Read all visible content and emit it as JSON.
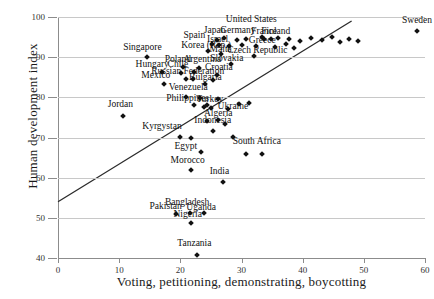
{
  "chart_data": {
    "type": "scatter",
    "title": "",
    "xlabel": "Voting, petitioning, demonstrating, boycotting",
    "ylabel": "Human development index",
    "xlim": [
      0,
      60
    ],
    "ylim": [
      40,
      100
    ],
    "xticks": [
      0,
      10,
      20,
      30,
      40,
      50,
      60
    ],
    "yticks": [
      40,
      50,
      60,
      70,
      80,
      90,
      100
    ],
    "grid": "horizontal",
    "legend": "none",
    "trendline": {
      "x0": 0,
      "y0": 54,
      "x1": 48,
      "y1": 99
    },
    "points": [
      {
        "label": "Sweden",
        "x": 58.7,
        "y": 96.5,
        "lx": 58.7,
        "ly": 99.0
      },
      {
        "label": "United States",
        "x": 33.4,
        "y": 95.0,
        "lx": 31.6,
        "ly": 99.2
      },
      {
        "label": "Japan",
        "x": 26.0,
        "y": 94.3,
        "lx": 25.6,
        "ly": 96.4
      },
      {
        "label": "Germany",
        "x": 29.3,
        "y": 94.2,
        "lx": 29.4,
        "ly": 96.4
      },
      {
        "label": "France",
        "x": 33.6,
        "y": 94.6,
        "lx": 33.7,
        "ly": 96.3
      },
      {
        "label": "Finland",
        "x": 36.0,
        "y": 94.7,
        "lx": 35.6,
        "ly": 96.3
      },
      {
        "label": "Spain",
        "x": 25.2,
        "y": 93.2,
        "lx": 22.3,
        "ly": 95.2
      },
      {
        "label": "Israel",
        "x": 26.4,
        "y": 93.0,
        "lx": 26.1,
        "ly": 94.2
      },
      {
        "label": "Greece",
        "x": 32.3,
        "y": 92.8,
        "lx": 33.4,
        "ly": 94.0
      },
      {
        "label": "Korea (Rep.)",
        "x": 24.6,
        "y": 91.6,
        "lx": 24.2,
        "ly": 92.9
      },
      {
        "label": "Malta",
        "x": 26.7,
        "y": 90.9,
        "lx": 26.6,
        "ly": 91.7
      },
      {
        "label": "Czech Republic",
        "x": 32.0,
        "y": 90.4,
        "lx": 32.6,
        "ly": 91.6
      },
      {
        "label": "Slovakia",
        "x": 28.3,
        "y": 88.2,
        "lx": 27.6,
        "ly": 89.6
      },
      {
        "label": "Singapore",
        "x": 14.5,
        "y": 90.0,
        "lx": 13.8,
        "ly": 92.2
      },
      {
        "label": "Poland",
        "x": 20.4,
        "y": 87.5,
        "lx": 19.6,
        "ly": 89.3
      },
      {
        "label": "Argentina",
        "x": 23.0,
        "y": 87.4,
        "lx": 23.6,
        "ly": 89.2
      },
      {
        "label": "Hungary",
        "x": 17.0,
        "y": 86.3,
        "lx": 15.4,
        "ly": 88.0
      },
      {
        "label": "Chile",
        "x": 20.1,
        "y": 86.0,
        "lx": 19.6,
        "ly": 88.0
      },
      {
        "label": "Croatia",
        "x": 26.0,
        "y": 85.6,
        "lx": 26.3,
        "ly": 87.2
      },
      {
        "label": "Russian Federation",
        "x": 21.0,
        "y": 84.5,
        "lx": 21.2,
        "ly": 86.2
      },
      {
        "label": "Mexico",
        "x": 17.3,
        "y": 83.3,
        "lx": 16.0,
        "ly": 85.3
      },
      {
        "label": "Bulgaria",
        "x": 24.0,
        "y": 83.3,
        "lx": 24.1,
        "ly": 84.9
      },
      {
        "label": "Venezuela",
        "x": 20.9,
        "y": 80.2,
        "lx": 21.3,
        "ly": 82.2
      },
      {
        "label": "Philippines",
        "x": 22.3,
        "y": 78.0,
        "lx": 21.2,
        "ly": 79.5
      },
      {
        "label": "Turkey",
        "x": 24.4,
        "y": 78.2,
        "lx": 24.8,
        "ly": 79.4
      },
      {
        "label": "Ukraine",
        "x": 27.8,
        "y": 77.0,
        "lx": 28.6,
        "ly": 77.7
      },
      {
        "label": "Jordan",
        "x": 10.6,
        "y": 75.4,
        "lx": 10.2,
        "ly": 78.0
      },
      {
        "label": "Algeria",
        "x": 26.2,
        "y": 74.3,
        "lx": 26.2,
        "ly": 75.8
      },
      {
        "label": "Indonesia",
        "x": 25.4,
        "y": 71.5,
        "lx": 25.3,
        "ly": 74.0
      },
      {
        "label": "Kyrgystan",
        "x": 20.0,
        "y": 70.2,
        "lx": 17.0,
        "ly": 72.6
      },
      {
        "label": "Egypt",
        "x": 23.3,
        "y": 66.5,
        "lx": 20.9,
        "ly": 67.6
      },
      {
        "label": "South Africa",
        "x": 33.4,
        "y": 66.0,
        "lx": 32.5,
        "ly": 68.8
      },
      {
        "label": "Morocco",
        "x": 21.7,
        "y": 61.8,
        "lx": 21.2,
        "ly": 64.2
      },
      {
        "label": "India",
        "x": 27.0,
        "y": 59.0,
        "lx": 26.4,
        "ly": 61.4
      },
      {
        "label": "Bangladesh",
        "x": 21.6,
        "y": 51.2,
        "lx": 21.1,
        "ly": 53.8
      },
      {
        "label": "Uganda",
        "x": 23.8,
        "y": 51.2,
        "lx": 23.4,
        "ly": 52.5
      },
      {
        "label": "Pakistan",
        "x": 19.3,
        "y": 51.0,
        "lx": 17.6,
        "ly": 52.6
      },
      {
        "label": "Nigeria",
        "x": 21.7,
        "y": 48.8,
        "lx": 21.2,
        "ly": 50.6
      },
      {
        "label": "Tanzania",
        "x": 22.7,
        "y": 40.7,
        "lx": 22.3,
        "ly": 43.4
      }
    ],
    "extra_points": [
      {
        "x": 27.2,
        "y": 94.8
      },
      {
        "x": 30.8,
        "y": 94.4
      },
      {
        "x": 34.9,
        "y": 94.4
      },
      {
        "x": 37.8,
        "y": 94.6
      },
      {
        "x": 39.6,
        "y": 94.1
      },
      {
        "x": 41.4,
        "y": 94.8
      },
      {
        "x": 43.2,
        "y": 94.2
      },
      {
        "x": 44.8,
        "y": 94.9
      },
      {
        "x": 46.1,
        "y": 93.8
      },
      {
        "x": 47.6,
        "y": 94.6
      },
      {
        "x": 49.1,
        "y": 94.0
      },
      {
        "x": 28.0,
        "y": 92.8
      },
      {
        "x": 30.0,
        "y": 93.1
      },
      {
        "x": 35.4,
        "y": 92.6
      },
      {
        "x": 37.2,
        "y": 93.2
      },
      {
        "x": 38.6,
        "y": 92.4
      },
      {
        "x": 22.3,
        "y": 86.4
      },
      {
        "x": 22.0,
        "y": 84.6
      },
      {
        "x": 25.3,
        "y": 84.3
      },
      {
        "x": 23.2,
        "y": 79.9
      },
      {
        "x": 26.1,
        "y": 79.7
      },
      {
        "x": 23.8,
        "y": 77.6
      },
      {
        "x": 25.0,
        "y": 77.4
      },
      {
        "x": 29.6,
        "y": 78.4
      },
      {
        "x": 31.2,
        "y": 78.6
      },
      {
        "x": 24.3,
        "y": 74.1
      },
      {
        "x": 27.3,
        "y": 73.4
      },
      {
        "x": 21.8,
        "y": 69.9
      },
      {
        "x": 28.6,
        "y": 70.1
      },
      {
        "x": 30.8,
        "y": 66.0
      }
    ]
  }
}
